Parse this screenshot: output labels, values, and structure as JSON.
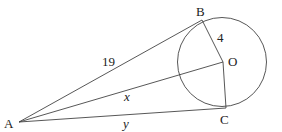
{
  "diagram": {
    "type": "geometry-tangent-circle",
    "points": {
      "A": {
        "label": "A",
        "x": 19,
        "y": 122
      },
      "B": {
        "label": "B",
        "x": 202,
        "y": 20
      },
      "O": {
        "label": "O",
        "x": 223,
        "y": 62
      },
      "C": {
        "label": "C",
        "x": 226,
        "y": 108
      }
    },
    "circle": {
      "cx": 222,
      "cy": 62,
      "r": 44.5
    },
    "segments": [
      {
        "from": "A",
        "to": "B",
        "label": "19"
      },
      {
        "from": "A",
        "to": "O",
        "label": "x"
      },
      {
        "from": "A",
        "to": "C",
        "label": "y"
      },
      {
        "from": "B",
        "to": "O",
        "label": "4"
      },
      {
        "from": "O",
        "to": "C",
        "label": ""
      }
    ],
    "labels": {
      "A": "A",
      "B": "B",
      "O": "O",
      "C": "C",
      "AB": "19",
      "AO": "x",
      "AC": "y",
      "BO": "4"
    }
  }
}
